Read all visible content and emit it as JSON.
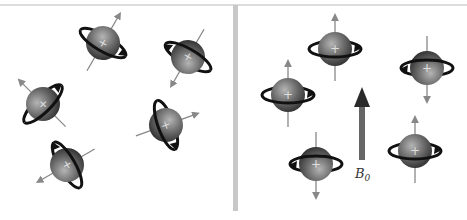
{
  "figure": {
    "left_panel": {
      "description": "Randomly oriented nuclear spins (no external field)",
      "spin_count": 5
    },
    "right_panel": {
      "description": "Nuclear spins aligned parallel or antiparallel with external field",
      "spin_count": 5,
      "field_label": "B",
      "field_label_subscript": "0"
    },
    "nucleus_symbol": "+",
    "colors": {
      "sphere": "#6e6e6e",
      "ring": "#111111",
      "axis": "#888888",
      "field_arrow": "#555555",
      "divider": "#c8c8c8",
      "top_border": "#d0d0d0"
    }
  }
}
